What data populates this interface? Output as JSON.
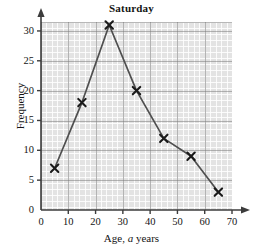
{
  "chart_data": {
    "type": "line",
    "title": "Saturday",
    "xlabel_prefix": "Age, ",
    "xlabel_italic": "a",
    "xlabel_suffix": " years",
    "ylabel": "Frequency",
    "x": [
      5,
      15,
      25,
      35,
      45,
      55,
      65
    ],
    "values": [
      7,
      18,
      31,
      20,
      12,
      9,
      3
    ],
    "series": [
      {
        "name": "Saturday frequency",
        "points": [
          {
            "x": 5,
            "y": 7
          },
          {
            "x": 15,
            "y": 18
          },
          {
            "x": 25,
            "y": 31
          },
          {
            "x": 35,
            "y": 20
          },
          {
            "x": 45,
            "y": 12
          },
          {
            "x": 55,
            "y": 9
          },
          {
            "x": 65,
            "y": 3
          }
        ]
      }
    ],
    "xlim": [
      0,
      70
    ],
    "ylim": [
      0,
      31.5
    ],
    "xticks": [
      0,
      10,
      20,
      30,
      40,
      50,
      60,
      70
    ],
    "yticks": [
      0,
      5,
      10,
      15,
      20,
      25,
      30
    ],
    "x_minor_step": 2,
    "y_minor_step": 1,
    "grid": true,
    "legend": null,
    "marker": "x-cross",
    "line_color": "#4f4f4f",
    "marker_color": "#1a1a1a",
    "plot_bg_color": "#e3e3e3",
    "major_grid_color": "#787878",
    "minor_grid_color": "#ffffff",
    "axis_color": "#3c3c3c",
    "x_axis_arrow": true,
    "y_axis_arrow": true
  }
}
